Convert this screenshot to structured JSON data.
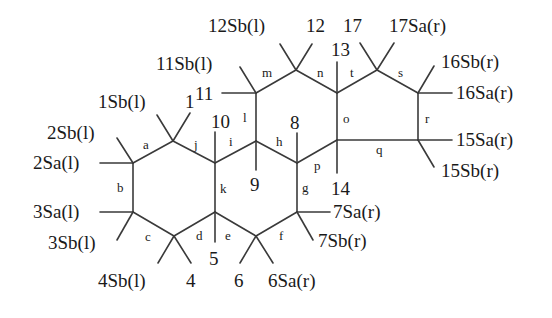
{
  "diagram": {
    "colors": {
      "line": "#3a3a3a",
      "text": "#1a1a1a",
      "background": "#ffffff"
    },
    "atoms": {
      "1": "1",
      "4": "4",
      "5": "5",
      "6": "6",
      "8": "8",
      "9": "9",
      "10": "10",
      "11": "11",
      "12": "12",
      "13": "13",
      "14": "14",
      "17": "17"
    },
    "substituents": {
      "s1Sb": "1Sb(l)",
      "s2Sb": "2Sb(l)",
      "s2Sa": "2Sa(l)",
      "s3Sa": "3Sa(l)",
      "s3Sb": "3Sb(l)",
      "s4Sb": "4Sb(l)",
      "s6Sa": "6Sa(r)",
      "s7Sa": "7Sa(r)",
      "s7Sb": "7Sb(r)",
      "s11Sb": "11Sb(l)",
      "s12Sb": "12Sb(l)",
      "s15Sa": "15Sa(r)",
      "s15Sb": "15Sb(r)",
      "s16Sa": "16Sa(r)",
      "s16Sb": "16Sb(r)",
      "s17Sa": "17Sa(r)"
    },
    "bonds": {
      "a": "a",
      "b": "b",
      "c": "c",
      "d": "d",
      "e": "e",
      "f": "f",
      "g": "g",
      "h": "h",
      "i": "i",
      "j": "j",
      "k": "k",
      "l": "l",
      "m": "m",
      "n": "n",
      "o": "o",
      "p": "p",
      "q": "q",
      "r": "r",
      "s": "s",
      "t": "t"
    }
  }
}
